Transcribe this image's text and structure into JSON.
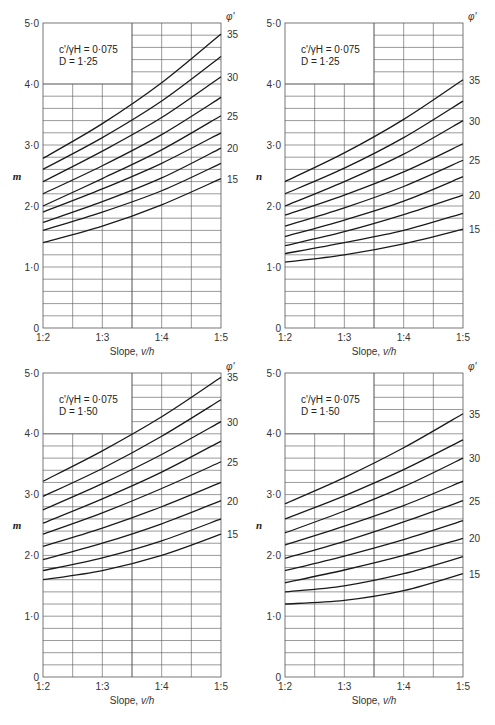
{
  "chart_data": [
    {
      "type": "line",
      "panel": "top-left",
      "ylabel": "m",
      "xlabel": "Slope, v/h",
      "annotation": [
        "c'/γH = 0·075",
        "D = 1·25"
      ],
      "legend_title": "φ'",
      "x": [
        "1:2",
        "1:3",
        "1:4",
        "1:5"
      ],
      "ylim": [
        0,
        5
      ],
      "yticks": [
        "0",
        "1·0",
        "2·0",
        "3·0",
        "4·0",
        "5·0"
      ],
      "curve_labels": [
        "35",
        "30",
        "25",
        "20",
        "15"
      ],
      "series": [
        {
          "name": "35",
          "values": [
            2.78,
            3.35,
            4.02,
            4.82
          ]
        },
        {
          "name": "32.5",
          "values": [
            2.6,
            3.12,
            3.72,
            4.45
          ]
        },
        {
          "name": "30",
          "values": [
            2.4,
            2.9,
            3.45,
            4.12
          ]
        },
        {
          "name": "27.5",
          "values": [
            2.2,
            2.66,
            3.17,
            3.78
          ]
        },
        {
          "name": "25",
          "values": [
            2.0,
            2.45,
            2.92,
            3.48
          ]
        },
        {
          "name": "22.5",
          "values": [
            1.9,
            2.28,
            2.7,
            3.2
          ]
        },
        {
          "name": "20",
          "values": [
            1.73,
            2.07,
            2.46,
            2.95
          ]
        },
        {
          "name": "17.5",
          "values": [
            1.6,
            1.9,
            2.25,
            2.7
          ]
        },
        {
          "name": "15",
          "values": [
            1.4,
            1.67,
            2.02,
            2.45
          ]
        }
      ]
    },
    {
      "type": "line",
      "panel": "top-right",
      "ylabel": "n",
      "xlabel": "Slope, v/h",
      "annotation": [
        "c'/γH = 0·075",
        "D = 1·25"
      ],
      "legend_title": "φ'",
      "x": [
        "1:2",
        "1:3",
        "1:4",
        "1:5"
      ],
      "ylim": [
        0,
        5
      ],
      "yticks": [
        "0",
        "1·0",
        "2·0",
        "3·0",
        "4·0",
        "5·0"
      ],
      "curve_labels": [
        "35",
        "30",
        "25",
        "20",
        "15"
      ],
      "series": [
        {
          "name": "35",
          "values": [
            2.4,
            2.87,
            3.42,
            4.07
          ]
        },
        {
          "name": "32.5",
          "values": [
            2.2,
            2.62,
            3.12,
            3.72
          ]
        },
        {
          "name": "30",
          "values": [
            2.0,
            2.4,
            2.85,
            3.4
          ]
        },
        {
          "name": "27.5",
          "values": [
            1.85,
            2.18,
            2.56,
            3.02
          ]
        },
        {
          "name": "25",
          "values": [
            1.67,
            1.97,
            2.32,
            2.75
          ]
        },
        {
          "name": "22.5",
          "values": [
            1.5,
            1.77,
            2.08,
            2.48
          ]
        },
        {
          "name": "20",
          "values": [
            1.35,
            1.58,
            1.86,
            2.18
          ]
        },
        {
          "name": "17.5",
          "values": [
            1.22,
            1.4,
            1.6,
            1.88
          ]
        },
        {
          "name": "15",
          "values": [
            1.08,
            1.2,
            1.38,
            1.62
          ]
        }
      ]
    },
    {
      "type": "line",
      "panel": "bottom-left",
      "ylabel": "m",
      "xlabel": "Slope, v/h",
      "annotation": [
        "c'/γH = 0·075",
        "D = 1·50"
      ],
      "legend_title": "φ'",
      "x": [
        "1:2",
        "1:3",
        "1:4",
        "1:5"
      ],
      "ylim": [
        0,
        5
      ],
      "yticks": [
        "0",
        "1·0",
        "2·0",
        "3·0",
        "4·0",
        "5·0"
      ],
      "curve_labels": [
        "35",
        "30",
        "25",
        "20",
        "15"
      ],
      "series": [
        {
          "name": "35",
          "values": [
            3.22,
            3.72,
            4.28,
            4.93
          ]
        },
        {
          "name": "32.5",
          "values": [
            2.97,
            3.43,
            3.96,
            4.56
          ]
        },
        {
          "name": "30",
          "values": [
            2.75,
            3.18,
            3.66,
            4.2
          ]
        },
        {
          "name": "27.5",
          "values": [
            2.53,
            2.93,
            3.37,
            3.88
          ]
        },
        {
          "name": "25",
          "values": [
            2.35,
            2.7,
            3.1,
            3.54
          ]
        },
        {
          "name": "22.5",
          "values": [
            2.15,
            2.45,
            2.8,
            3.2
          ]
        },
        {
          "name": "20",
          "values": [
            1.93,
            2.2,
            2.52,
            2.9
          ]
        },
        {
          "name": "17.5",
          "values": [
            1.75,
            1.96,
            2.24,
            2.6
          ]
        },
        {
          "name": "15",
          "values": [
            1.6,
            1.75,
            2.0,
            2.35
          ]
        }
      ]
    },
    {
      "type": "line",
      "panel": "bottom-right",
      "ylabel": "n",
      "xlabel": "Slope, v/h",
      "annotation": [
        "c'/γH = 0·075",
        "D = 1·50"
      ],
      "legend_title": "φ'",
      "x": [
        "1:2",
        "1:3",
        "1:4",
        "1:5"
      ],
      "ylim": [
        0,
        5
      ],
      "yticks": [
        "0",
        "1·0",
        "2·0",
        "3·0",
        "4·0",
        "5·0"
      ],
      "curve_labels": [
        "35",
        "30",
        "25",
        "20",
        "15"
      ],
      "series": [
        {
          "name": "35",
          "values": [
            2.85,
            3.28,
            3.77,
            4.33
          ]
        },
        {
          "name": "32.5",
          "values": [
            2.6,
            2.98,
            3.41,
            3.9
          ]
        },
        {
          "name": "30",
          "values": [
            2.37,
            2.73,
            3.13,
            3.6
          ]
        },
        {
          "name": "27.5",
          "values": [
            2.17,
            2.48,
            2.82,
            3.22
          ]
        },
        {
          "name": "25",
          "values": [
            1.95,
            2.23,
            2.55,
            2.9
          ]
        },
        {
          "name": "22.5",
          "values": [
            1.75,
            1.99,
            2.26,
            2.57
          ]
        },
        {
          "name": "20",
          "values": [
            1.55,
            1.76,
            2.0,
            2.28
          ]
        },
        {
          "name": "17.5",
          "values": [
            1.4,
            1.5,
            1.7,
            1.98
          ]
        },
        {
          "name": "15",
          "values": [
            1.2,
            1.26,
            1.42,
            1.7
          ]
        }
      ]
    }
  ],
  "layout": {
    "panels": [
      {
        "left": 43,
        "right": 221,
        "top": 23,
        "bottom": 328
      },
      {
        "left": 285,
        "right": 463,
        "top": 23,
        "bottom": 328
      },
      {
        "left": 43,
        "right": 221,
        "top": 373,
        "bottom": 677
      },
      {
        "left": 285,
        "right": 463,
        "top": 373,
        "bottom": 677
      }
    ],
    "line_color": "#1a1a1a",
    "grid_color": "#555555"
  }
}
